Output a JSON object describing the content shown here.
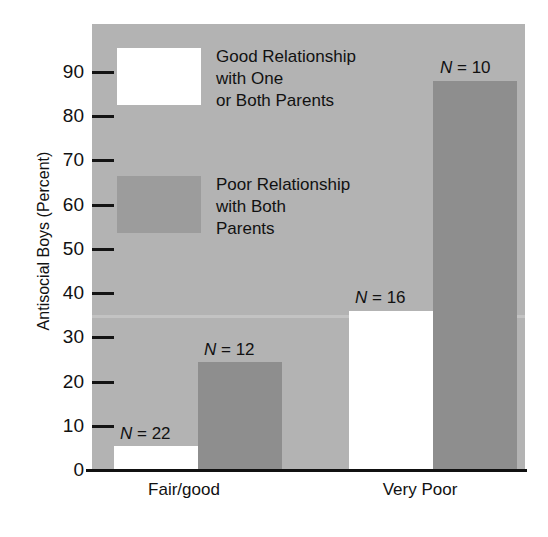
{
  "chart_data": {
    "type": "bar",
    "title": "",
    "xlabel": "",
    "ylabel": "Antisocial Boys (Percent)",
    "ylim": [
      0,
      95
    ],
    "ytick_values": [
      0,
      10,
      20,
      30,
      40,
      50,
      60,
      70,
      80,
      90
    ],
    "ytick_labels": [
      "0",
      "10",
      "20",
      "30",
      "40",
      "50",
      "60",
      "70",
      "80",
      "90"
    ],
    "grid": false,
    "legend_position": "inside-upper-left",
    "categories": [
      "Fair/good",
      "Very Poor"
    ],
    "series": [
      {
        "name": "Good Relationship\nwith One\nor Both Parents",
        "color": "#ffffff",
        "values": [
          5.5,
          36
        ],
        "point_labels": [
          "N = 22",
          "N = 16"
        ]
      },
      {
        "name": "Poor Relationship\nwith Both\nParents",
        "color": "#8e8e8e",
        "values": [
          24.5,
          88
        ],
        "point_labels": [
          "N = 12",
          "N = 10"
        ]
      }
    ],
    "annotations": [
      "N = 22",
      "N = 12",
      "N = 16",
      "N = 10"
    ],
    "panel_background": "#b3b3b3"
  },
  "axis": {
    "y_title": "Antisocial Boys (Percent)",
    "ticks": [
      {
        "label": "90",
        "value": 90
      },
      {
        "label": "80",
        "value": 80
      },
      {
        "label": "70",
        "value": 70
      },
      {
        "label": "60",
        "value": 60
      },
      {
        "label": "50",
        "value": 50
      },
      {
        "label": "40",
        "value": 40
      },
      {
        "label": "30",
        "value": 30
      },
      {
        "label": "20",
        "value": 20
      },
      {
        "label": "10",
        "value": 10
      },
      {
        "label": "0",
        "value": 0
      }
    ]
  },
  "categories": [
    {
      "label": "Fair/good"
    },
    {
      "label": "Very Poor"
    }
  ],
  "bars": [
    {
      "id": "fairgood-good",
      "n_label": "N = 22",
      "value": 5.5
    },
    {
      "id": "fairgood-poor",
      "n_label": "N = 12",
      "value": 24.5
    },
    {
      "id": "verypoor-good",
      "n_label": "N = 16",
      "value": 36
    },
    {
      "id": "verypoor-poor",
      "n_label": "N = 10",
      "value": 88
    }
  ],
  "legend": [
    {
      "label": "Good Relationship\nwith One\nor Both Parents",
      "color": "#ffffff"
    },
    {
      "label": "Poor Relationship\nwith Both\nParents",
      "color": "#9c9c9c"
    }
  ]
}
